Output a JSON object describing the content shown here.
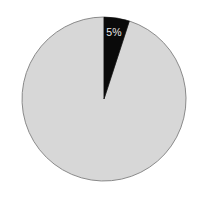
{
  "chart_data": {
    "type": "pie",
    "title": "",
    "categories": [
      "Highlighted segment",
      "Remainder"
    ],
    "values": [
      5,
      95
    ],
    "labels": [
      "5%",
      ""
    ],
    "units": "percent",
    "start_angle_deg": 0,
    "direction": "clockwise",
    "legend": "none",
    "grid": false,
    "colors": {
      "highlighted_slice": "#0a0a0a",
      "remainder_slice": "#d7d7d7",
      "slice_outline": "#8a8a8a",
      "background": "#ffffff",
      "label_text": "#e8e8e8"
    },
    "geometry": {
      "center_x": 104,
      "center_y": 99,
      "radius": 82
    },
    "annotations": [
      {
        "text": "5%",
        "x": 114,
        "y": 36,
        "color": "#e8e8e8",
        "attached_to": "Highlighted segment"
      }
    ]
  },
  "figure": {
    "alt": "Pie chart with a single small black wedge labeled 5% and a large light gray remainder"
  }
}
